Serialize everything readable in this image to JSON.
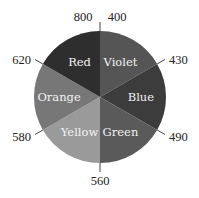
{
  "diagram": {
    "title": "",
    "slices": [
      {
        "name": "Violet",
        "from": 400,
        "to": 430,
        "color": "#555555"
      },
      {
        "name": "Blue",
        "from": 430,
        "to": 490,
        "color": "#3c3c3c"
      },
      {
        "name": "Green",
        "from": 490,
        "to": 560,
        "color": "#5a5a5a"
      },
      {
        "name": "Yellow",
        "from": 560,
        "to": 580,
        "color": "#9a9a9a"
      },
      {
        "name": "Orange",
        "from": 580,
        "to": 620,
        "color": "#777777"
      },
      {
        "name": "Red",
        "from": 620,
        "to": 800,
        "color": "#2e2e2e"
      }
    ],
    "boundaries": [
      {
        "value": "400",
        "position": "top-right"
      },
      {
        "value": "430",
        "position": "upper-right"
      },
      {
        "value": "490",
        "position": "lower-right"
      },
      {
        "value": "560",
        "position": "bottom"
      },
      {
        "value": "580",
        "position": "lower-left"
      },
      {
        "value": "620",
        "position": "upper-left"
      },
      {
        "value": "800",
        "position": "top-left"
      }
    ]
  }
}
